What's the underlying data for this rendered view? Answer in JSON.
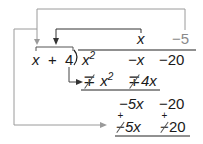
{
  "diagram": {
    "divisor": {
      "term1": "x",
      "op": "+",
      "term2": "4"
    },
    "quotient": {
      "term1": "x",
      "term2": "−5"
    },
    "dividend": {
      "term1": "x",
      "exp1": "2",
      "term2": "−x",
      "term3": "−20"
    },
    "step1_subtract": {
      "sign1_top": "∓",
      "term1": "x",
      "exp1": "2",
      "sign2": "∓",
      "term2": "4x"
    },
    "step1_remainder": {
      "term1": "−5x",
      "term2": "−20"
    },
    "step2_subtract": {
      "sign1_top": "+",
      "sign1": "−",
      "term1": "5x",
      "sign2_top": "+",
      "sign2": "−",
      "term2": "20"
    },
    "colors": {
      "text": "#1a1a1a",
      "gray_text": "#8a8a8a",
      "connector_gray": "#9a9a9a",
      "connector_dark": "#333333"
    }
  }
}
